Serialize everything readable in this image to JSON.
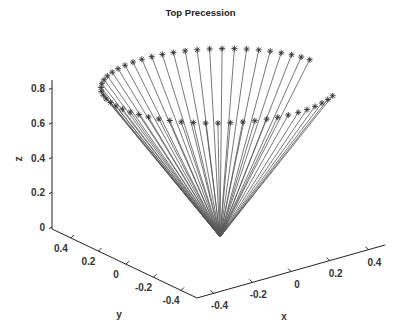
{
  "chart_data": {
    "type": "line3d",
    "title": "Top Precession",
    "xlabel": "x",
    "ylabel": "y",
    "zlabel": "z",
    "xticks": [
      -0.4,
      -0.2,
      0,
      0.2,
      0.4
    ],
    "yticks": [
      0.4,
      0.2,
      0,
      -0.2,
      -0.4
    ],
    "zticks": [
      0,
      0.2,
      0.4,
      0.6,
      0.8
    ],
    "xlim": [
      -0.5,
      0.5
    ],
    "ylim": [
      -0.5,
      0.5
    ],
    "zlim": [
      0,
      0.85
    ],
    "grid": false,
    "marker": "*",
    "line_color": "#555555",
    "marker_color": "#333333",
    "apex": [
      0,
      0,
      0
    ],
    "series": [
      {
        "name": "top axis tip trajectory",
        "description": "Lines from origin (apex) to each tip position, tip marked with *",
        "z": 0.87,
        "points": [
          [
            0.287,
            -0.41
          ],
          [
            0.242,
            -0.437
          ],
          [
            0.195,
            -0.46
          ],
          [
            0.146,
            -0.478
          ],
          [
            0.095,
            -0.491
          ],
          [
            0.044,
            -0.498
          ],
          [
            -0.009,
            -0.5
          ],
          [
            -0.061,
            -0.496
          ],
          [
            -0.112,
            -0.487
          ],
          [
            -0.163,
            -0.473
          ],
          [
            -0.211,
            -0.453
          ],
          [
            -0.258,
            -0.429
          ],
          [
            -0.301,
            -0.399
          ],
          [
            -0.341,
            -0.366
          ],
          [
            -0.377,
            -0.328
          ],
          [
            -0.41,
            -0.287
          ],
          [
            -0.437,
            -0.242
          ],
          [
            -0.46,
            -0.195
          ],
          [
            -0.478,
            -0.146
          ],
          [
            -0.491,
            -0.095
          ],
          [
            -0.498,
            -0.044
          ],
          [
            -0.5,
            0.009
          ],
          [
            -0.496,
            0.061
          ],
          [
            -0.487,
            0.112
          ],
          [
            -0.473,
            0.163
          ],
          [
            -0.453,
            0.211
          ],
          [
            -0.429,
            0.258
          ],
          [
            -0.399,
            0.301
          ],
          [
            -0.366,
            0.341
          ],
          [
            -0.328,
            0.377
          ],
          [
            -0.287,
            0.41
          ],
          [
            -0.242,
            0.437
          ],
          [
            -0.195,
            0.46
          ],
          [
            -0.146,
            0.478
          ],
          [
            -0.095,
            0.491
          ],
          [
            -0.044,
            0.498
          ],
          [
            0.009,
            0.5
          ],
          [
            0.061,
            0.496
          ],
          [
            0.112,
            0.487
          ],
          [
            0.163,
            0.473
          ],
          [
            0.211,
            0.453
          ],
          [
            0.258,
            0.429
          ],
          [
            0.301,
            0.399
          ],
          [
            0.341,
            0.366
          ],
          [
            0.377,
            0.328
          ],
          [
            0.41,
            0.287
          ],
          [
            0.437,
            0.242
          ],
          [
            0.46,
            0.195
          ],
          [
            0.478,
            0.146
          ],
          [
            0.491,
            0.095
          ],
          [
            0.498,
            0.044
          ]
        ]
      }
    ]
  }
}
